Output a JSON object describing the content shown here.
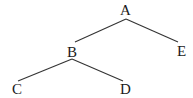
{
  "tree": {
    "nodes": [
      {
        "id": "A",
        "label": "A",
        "x": 125.5,
        "y": 15
      },
      {
        "id": "B",
        "label": "B",
        "x": 72,
        "y": 57
      },
      {
        "id": "E",
        "label": "E",
        "x": 181.5,
        "y": 56
      },
      {
        "id": "C",
        "label": "C",
        "x": 17,
        "y": 94
      },
      {
        "id": "D",
        "label": "D",
        "x": 125.5,
        "y": 94
      }
    ],
    "edges": [
      {
        "from": "A",
        "to": "B",
        "x1": 126,
        "y1": 19,
        "x2": 75,
        "y2": 42
      },
      {
        "from": "A",
        "to": "E",
        "x1": 126,
        "y1": 19,
        "x2": 178,
        "y2": 42
      },
      {
        "from": "B",
        "to": "C",
        "x1": 72,
        "y1": 59,
        "x2": 18,
        "y2": 81
      },
      {
        "from": "B",
        "to": "D",
        "x1": 72,
        "y1": 59,
        "x2": 123,
        "y2": 81
      }
    ]
  }
}
